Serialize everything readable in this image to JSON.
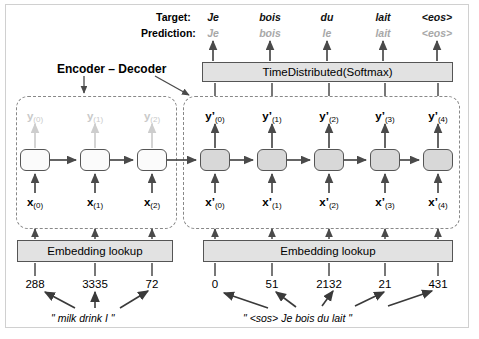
{
  "figure": {
    "heading": "Encoder – Decoder",
    "rows": {
      "target_label": "Target:",
      "prediction_label": "Prediction:"
    },
    "target_tokens": [
      "Je",
      "bois",
      "du",
      "lait",
      "<eos>"
    ],
    "prediction_tokens": [
      "Je",
      "bois",
      "le",
      "lait",
      "<eos>"
    ],
    "softmax_box": "TimeDistributed(Softmax)",
    "embedding_box_left": "Embedding lookup",
    "embedding_box_right": "Embedding lookup",
    "encoder": {
      "cells": 3,
      "input_labels": [
        "x(0)",
        "x(1)",
        "x(2)"
      ],
      "output_labels": [
        "y(0)",
        "y(1)",
        "y(2)"
      ],
      "token_ids": [
        "288",
        "3335",
        "72"
      ],
      "sentence": "\" milk drink I \""
    },
    "decoder": {
      "cells": 5,
      "input_labels": [
        "x'(0)",
        "x'(1)",
        "x'(2)",
        "x'(3)",
        "x'(4)"
      ],
      "output_labels": [
        "y'(0)",
        "y'(1)",
        "y'(2)",
        "y'(3)",
        "y'(4)"
      ],
      "token_ids": [
        "0",
        "51",
        "2132",
        "21",
        "431"
      ],
      "sentence": "\" <sos> Je bois du lait \""
    },
    "colors": {
      "encoder_cell_fill": "#fbfbfb",
      "decoder_cell_fill": "#d8d8d8",
      "box_fill": "#e2e2e2",
      "stroke": "#555555",
      "faint_text": "#c9c9c9",
      "prediction_text": "#a8a8a8",
      "frame_border": "#d0d0d0"
    }
  }
}
